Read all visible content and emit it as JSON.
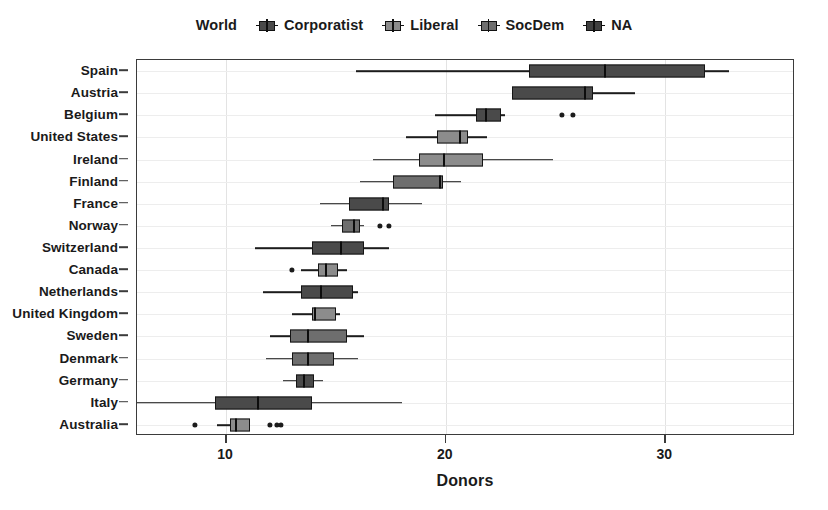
{
  "legend": {
    "items": [
      {
        "label": "World",
        "glyph": false,
        "color": ""
      },
      {
        "label": "Corporatist",
        "glyph": true,
        "color": "#4a4a4a"
      },
      {
        "label": "Liberal",
        "glyph": true,
        "color": "#8c8c8c"
      },
      {
        "label": "SocDem",
        "glyph": true,
        "color": "#6e6e6e"
      },
      {
        "label": "NA",
        "glyph": true,
        "color": "#3f3f3f"
      }
    ]
  },
  "axes": {
    "x_title": "Donors",
    "x_ticks": [
      10,
      20,
      30
    ],
    "x_tick_labels": [
      "10",
      "20",
      "30"
    ],
    "x_min": 5.95,
    "x_max": 35.9,
    "grid": true
  },
  "colors": {
    "corporatist": "#4a4a4a",
    "liberal": "#8c8c8c",
    "socdem": "#6e6e6e",
    "na": "#3f3f3f",
    "panel_border": "#3b3b3b",
    "gridline": "#e6e6e6",
    "stroke": "#151515"
  },
  "chart_data": {
    "type": "boxplot",
    "title": "",
    "xlabel": "Donors",
    "ylabel": "",
    "xlim": [
      5.95,
      35.9
    ],
    "grid": true,
    "legend_position": "top-center",
    "legend_entries": [
      "World",
      "Corporatist",
      "Liberal",
      "SocDem",
      "NA"
    ],
    "categories": [
      "Spain",
      "Austria",
      "Belgium",
      "United States",
      "Ireland",
      "Finland",
      "France",
      "Norway",
      "Switzerland",
      "Canada",
      "Netherlands",
      "United Kingdom",
      "Sweden",
      "Denmark",
      "Germany",
      "Italy",
      "Australia"
    ],
    "boxes": [
      {
        "label": "Spain",
        "group": "corporatist",
        "whisker_low": 15.9,
        "q1": 23.8,
        "median": 27.2,
        "q3": 31.8,
        "whisker_high": 32.9,
        "outliers": []
      },
      {
        "label": "Austria",
        "group": "corporatist",
        "whisker_low": 25.1,
        "q1": 23.0,
        "median": 26.3,
        "q3": 26.7,
        "whisker_high": 28.6,
        "outliers": []
      },
      {
        "label": "Belgium",
        "group": "corporatist",
        "whisker_low": 19.5,
        "q1": 21.4,
        "median": 21.8,
        "q3": 22.5,
        "whisker_high": 22.7,
        "outliers": [
          25.3,
          25.8
        ]
      },
      {
        "label": "United States",
        "group": "liberal",
        "whisker_low": 18.2,
        "q1": 19.6,
        "median": 20.6,
        "q3": 21.0,
        "whisker_high": 21.9,
        "outliers": []
      },
      {
        "label": "Ireland",
        "group": "liberal",
        "whisker_low": 16.7,
        "q1": 18.8,
        "median": 19.9,
        "q3": 21.7,
        "whisker_high": 24.9,
        "outliers": []
      },
      {
        "label": "Finland",
        "group": "socdem",
        "whisker_low": 16.1,
        "q1": 17.6,
        "median": 19.7,
        "q3": 19.9,
        "whisker_high": 20.7,
        "outliers": []
      },
      {
        "label": "France",
        "group": "corporatist",
        "whisker_low": 14.3,
        "q1": 15.6,
        "median": 17.1,
        "q3": 17.4,
        "whisker_high": 18.9,
        "outliers": []
      },
      {
        "label": "Norway",
        "group": "socdem",
        "whisker_low": 14.8,
        "q1": 15.3,
        "median": 15.8,
        "q3": 16.1,
        "whisker_high": 16.3,
        "outliers": [
          17.0,
          17.4
        ]
      },
      {
        "label": "Switzerland",
        "group": "corporatist",
        "whisker_low": 11.3,
        "q1": 13.9,
        "median": 15.2,
        "q3": 16.3,
        "whisker_high": 17.4,
        "outliers": []
      },
      {
        "label": "Canada",
        "group": "liberal",
        "whisker_low": 13.4,
        "q1": 14.2,
        "median": 14.5,
        "q3": 15.1,
        "whisker_high": 15.5,
        "outliers": [
          13.0
        ]
      },
      {
        "label": "Netherlands",
        "group": "corporatist",
        "whisker_low": 11.7,
        "q1": 13.4,
        "median": 14.3,
        "q3": 15.8,
        "whisker_high": 16.0,
        "outliers": []
      },
      {
        "label": "United Kingdom",
        "group": "liberal",
        "whisker_low": 13.0,
        "q1": 13.9,
        "median": 14.0,
        "q3": 15.0,
        "whisker_high": 15.2,
        "outliers": []
      },
      {
        "label": "Sweden",
        "group": "socdem",
        "whisker_low": 12.0,
        "q1": 12.9,
        "median": 13.7,
        "q3": 15.5,
        "whisker_high": 16.3,
        "outliers": []
      },
      {
        "label": "Denmark",
        "group": "socdem",
        "whisker_low": 11.8,
        "q1": 13.0,
        "median": 13.7,
        "q3": 14.9,
        "whisker_high": 16.0,
        "outliers": []
      },
      {
        "label": "Germany",
        "group": "corporatist",
        "whisker_low": 12.6,
        "q1": 13.2,
        "median": 13.5,
        "q3": 14.0,
        "whisker_high": 14.4,
        "outliers": []
      },
      {
        "label": "Italy",
        "group": "corporatist",
        "whisker_low": 5.95,
        "q1": 9.5,
        "median": 11.4,
        "q3": 13.9,
        "whisker_high": 18.0,
        "outliers": []
      },
      {
        "label": "Australia",
        "group": "liberal",
        "whisker_low": 9.6,
        "q1": 10.2,
        "median": 10.4,
        "q3": 11.1,
        "whisker_high": 11.1,
        "outliers": [
          8.6,
          12.0,
          12.3,
          12.5
        ]
      }
    ]
  }
}
